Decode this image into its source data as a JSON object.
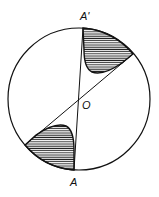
{
  "diagram": {
    "labels": {
      "top": "A'",
      "bottom": "A",
      "center": "O"
    },
    "circle": {
      "cx": 79,
      "cy": 99,
      "r": 71
    },
    "shading": "hatched",
    "stroke_color": "#111111"
  }
}
